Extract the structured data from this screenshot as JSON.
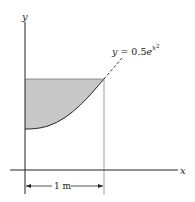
{
  "diagram": {
    "axes": {
      "x_label": "x",
      "y_label": "y"
    },
    "curve": {
      "label_lhs": "y = 0.5",
      "label_base": "e",
      "label_exp": "x",
      "label_exp_power": "2"
    },
    "dimension": {
      "label": "1 m"
    },
    "colors": {
      "shade": "#c8c8c8",
      "line": "#222222",
      "guide": "#888888"
    }
  }
}
